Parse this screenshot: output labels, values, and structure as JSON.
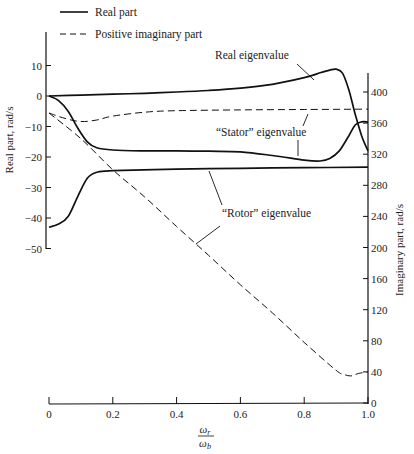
{
  "chart_data": {
    "type": "line",
    "title": "",
    "xlabel": "ω_r / ω_b",
    "ylabel": "Real part, rad/s",
    "y2label": "Imaginary part, rad/s",
    "xlim": [
      0,
      1.0
    ],
    "ylim": [
      -50,
      15
    ],
    "y2lim": [
      0,
      400
    ],
    "grid": false,
    "legend_position": "top-left",
    "legend": [
      {
        "label": "Real part",
        "style": "solid"
      },
      {
        "label": "Positive imaginary part",
        "style": "dashed"
      }
    ],
    "x_ticks": [
      "0",
      "0.2",
      "0.4",
      "0.6",
      "0.8",
      "1.0"
    ],
    "y_ticks": [
      "10",
      "0",
      "−10",
      "−20",
      "−30",
      "−40",
      "−50"
    ],
    "y2_ticks": [
      "400",
      "360",
      "320",
      "280",
      "240",
      "200",
      "160",
      "120",
      "80",
      "40",
      "0"
    ],
    "annotations": [
      {
        "text": "Real eigenvalue"
      },
      {
        "text": "“Stator” eigenvalue"
      },
      {
        "text": "“Rotor” eigenvalue"
      }
    ],
    "series": [
      {
        "name": "Real eigenvalue (real part)",
        "axis": "left",
        "style": "solid",
        "x": [
          0,
          0.1,
          0.2,
          0.3,
          0.4,
          0.5,
          0.6,
          0.7,
          0.8,
          0.85,
          0.88,
          0.9,
          0.92,
          0.94,
          0.96,
          0.98,
          1.0
        ],
        "y": [
          0,
          0.3,
          0.6,
          0.9,
          1.3,
          1.8,
          2.6,
          3.8,
          6.0,
          7.6,
          8.5,
          8.8,
          7.5,
          2,
          -6,
          -13,
          -18
        ]
      },
      {
        "name": "Stator eigenvalue (real part)",
        "axis": "left",
        "style": "solid",
        "x": [
          0,
          0.03,
          0.06,
          0.09,
          0.12,
          0.15,
          0.2,
          0.3,
          0.4,
          0.5,
          0.6,
          0.7,
          0.8,
          0.85,
          0.88,
          0.91,
          0.94,
          0.96,
          0.98,
          1.0
        ],
        "y": [
          0,
          -1.5,
          -5,
          -10.5,
          -15,
          -17,
          -17.7,
          -18,
          -18,
          -18.1,
          -18.3,
          -19.5,
          -21,
          -21.3,
          -20.5,
          -18,
          -13,
          -9.5,
          -8.5,
          -8.5
        ]
      },
      {
        "name": "Rotor eigenvalue (real part)",
        "axis": "left",
        "style": "solid",
        "x": [
          0,
          0.03,
          0.06,
          0.09,
          0.12,
          0.15,
          0.2,
          0.4,
          0.6,
          0.8,
          1.0
        ],
        "y": [
          -43,
          -42,
          -39.5,
          -33,
          -27,
          -25,
          -24.5,
          -24,
          -23.7,
          -23.5,
          -23.3
        ]
      },
      {
        "name": "Stator eigenvalue (imaginary part)",
        "axis": "right",
        "style": "dashed",
        "x": [
          0,
          0.05,
          0.1,
          0.15,
          0.2,
          0.3,
          0.4,
          0.6,
          0.8,
          1.0
        ],
        "y": [
          373,
          366,
          362,
          364,
          369,
          374,
          376,
          377,
          377.5,
          378
        ]
      },
      {
        "name": "Rotor eigenvalue (imaginary part)",
        "axis": "right",
        "style": "dashed",
        "x": [
          0,
          0.1,
          0.2,
          0.3,
          0.4,
          0.5,
          0.6,
          0.7,
          0.8,
          0.9,
          0.93,
          0.95,
          0.97,
          1.0
        ],
        "y": [
          373,
          340,
          300,
          265,
          227,
          190,
          152,
          116,
          78,
          42,
          36,
          35,
          38,
          40
        ]
      }
    ]
  },
  "legend": {
    "solid_label": "Real part",
    "dashed_label": "Positive imaginary part"
  },
  "axes": {
    "left_title": "Real part, rad/s",
    "right_title": "Imaginary part, rad/s",
    "x_title_num": "ω",
    "x_title_num_sub": "r",
    "x_title_den": "ω",
    "x_title_den_sub": "b",
    "x_ticks": [
      "0",
      "0.2",
      "0.4",
      "0.6",
      "0.8",
      "1.0"
    ],
    "left_ticks": [
      "10",
      "0",
      "−10",
      "−20",
      "−30",
      "−40",
      "−50"
    ],
    "right_ticks": [
      "400",
      "360",
      "320",
      "280",
      "240",
      "200",
      "160",
      "120",
      "80",
      "40",
      "0"
    ]
  },
  "annotations": {
    "real": "Real eigenvalue",
    "stator": "“Stator” eigenvalue",
    "rotor": "“Rotor” eigenvalue"
  }
}
